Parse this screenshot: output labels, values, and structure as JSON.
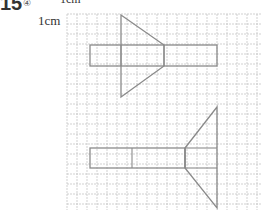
{
  "question": {
    "number": "15",
    "mark": "④",
    "unit_label": "1cm",
    "unit_label_top": "1cm"
  },
  "grid": {
    "left": 67,
    "top": 14,
    "right": 262,
    "bottom": 210,
    "cell": 10,
    "line_color": "#bdbdbd"
  },
  "figures": [
    {
      "name": "top-figure",
      "stroke": "#8a8a8a",
      "rect": {
        "x": 90,
        "y": 45,
        "w": 127,
        "h": 21
      },
      "triangle": [
        [
          121,
          15
        ],
        [
          164,
          45
        ],
        [
          164,
          66
        ],
        [
          121,
          97
        ]
      ],
      "inner_lines": [
        [
          [
            121,
            45
          ],
          [
            121,
            66
          ]
        ],
        [
          [
            164,
            45
          ],
          [
            164,
            66
          ]
        ]
      ]
    },
    {
      "name": "bottom-figure",
      "stroke": "#8a8a8a",
      "rect": {
        "x": 90,
        "y": 148,
        "w": 95,
        "h": 20
      },
      "triangle": [
        [
          185,
          148
        ],
        [
          217,
          107
        ],
        [
          217,
          208
        ],
        [
          185,
          168
        ]
      ],
      "inner_lines": [
        [
          [
            132,
            148
          ],
          [
            132,
            168
          ]
        ],
        [
          [
            185,
            148
          ],
          [
            185,
            168
          ]
        ],
        [
          [
            185,
            148
          ],
          [
            217,
            148
          ]
        ],
        [
          [
            185,
            168
          ],
          [
            217,
            168
          ]
        ]
      ]
    }
  ]
}
